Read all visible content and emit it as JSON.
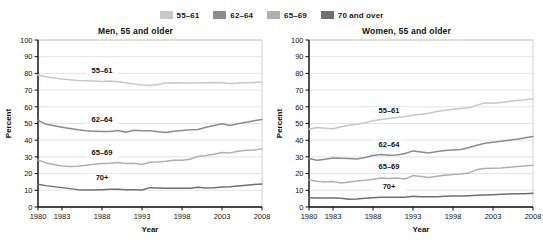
{
  "legend": {
    "position": "top-center",
    "items": [
      {
        "label": "55–61",
        "color": "#c8c8c8",
        "icon": "legend-swatch-icon"
      },
      {
        "label": "62–64",
        "color": "#8c8c8c",
        "icon": "legend-swatch-icon"
      },
      {
        "label": "65–69",
        "color": "#b0b0b0",
        "icon": "legend-swatch-icon"
      },
      {
        "label": "70 and over",
        "color": "#707070",
        "icon": "legend-swatch-icon"
      }
    ]
  },
  "chart_data": [
    {
      "type": "line",
      "title": "Men, 55 and older",
      "xlabel": "Year",
      "ylabel": "Percent",
      "xlim": [
        1980,
        2008
      ],
      "ylim": [
        0,
        100
      ],
      "grid": true,
      "legend_position": "top-center-shared",
      "xticks": [
        1980,
        1983,
        1988,
        1993,
        1998,
        2003,
        2008
      ],
      "yticks": [
        0,
        10,
        20,
        30,
        40,
        50,
        60,
        70,
        80,
        90,
        100
      ],
      "x": [
        1980,
        1981,
        1982,
        1983,
        1984,
        1985,
        1986,
        1987,
        1988,
        1989,
        1990,
        1991,
        1992,
        1993,
        1994,
        1995,
        1996,
        1997,
        1998,
        1999,
        2000,
        2001,
        2002,
        2003,
        2004,
        2005,
        2006,
        2007,
        2008
      ],
      "series": [
        {
          "name": "55–61",
          "color": "#c8c8c8",
          "label_x": 1988,
          "label_y": 80,
          "values": [
            79.0,
            78.0,
            77.2,
            76.6,
            76.2,
            75.8,
            75.6,
            75.4,
            75.2,
            75.4,
            75.0,
            74.4,
            73.6,
            73.0,
            72.8,
            73.4,
            74.2,
            74.4,
            74.2,
            74.2,
            74.4,
            74.4,
            74.6,
            74.4,
            74.0,
            74.2,
            74.4,
            74.6,
            74.8
          ]
        },
        {
          "name": "62–64",
          "color": "#8c8c8c",
          "label_x": 1988,
          "label_y": 51,
          "values": [
            52.0,
            49.5,
            48.6,
            47.8,
            47.0,
            46.2,
            45.6,
            45.4,
            45.2,
            45.2,
            45.8,
            44.8,
            46.0,
            45.6,
            45.6,
            45.0,
            44.6,
            45.4,
            45.8,
            46.2,
            46.4,
            47.8,
            48.8,
            49.8,
            48.8,
            49.8,
            50.8,
            51.6,
            52.4
          ]
        },
        {
          "name": "65–69",
          "color": "#b0b0b0",
          "label_x": 1988,
          "label_y": 31,
          "values": [
            28.2,
            26.4,
            25.4,
            24.6,
            24.2,
            24.4,
            25.0,
            25.6,
            26.0,
            26.2,
            26.6,
            26.0,
            26.2,
            25.4,
            26.8,
            27.0,
            27.4,
            28.0,
            28.0,
            28.6,
            30.2,
            30.8,
            31.6,
            32.6,
            32.4,
            33.4,
            34.0,
            34.2,
            34.8
          ]
        },
        {
          "name": "70+",
          "color": "#707070",
          "label_x": 1988,
          "label_y": 16,
          "values": [
            13.6,
            12.8,
            12.2,
            11.6,
            11.0,
            10.4,
            10.2,
            10.2,
            10.4,
            10.6,
            10.6,
            10.4,
            10.4,
            10.2,
            11.6,
            11.4,
            11.2,
            11.2,
            11.2,
            11.2,
            11.8,
            11.4,
            11.6,
            12.0,
            12.2,
            12.6,
            13.0,
            13.4,
            13.8
          ]
        }
      ]
    },
    {
      "type": "line",
      "title": "Women, 55 and older",
      "xlabel": "Year",
      "ylabel": "Percent",
      "xlim": [
        1980,
        2008
      ],
      "ylim": [
        0,
        100
      ],
      "grid": true,
      "legend_position": "top-center-shared",
      "xticks": [
        1980,
        1983,
        1988,
        1993,
        1998,
        2003,
        2008
      ],
      "yticks": [
        0,
        10,
        20,
        30,
        40,
        50,
        60,
        70,
        80,
        90,
        100
      ],
      "x": [
        1980,
        1981,
        1982,
        1983,
        1984,
        1985,
        1986,
        1987,
        1988,
        1989,
        1990,
        1991,
        1992,
        1993,
        1994,
        1995,
        1996,
        1997,
        1998,
        1999,
        2000,
        2001,
        2002,
        2003,
        2004,
        2005,
        2006,
        2007,
        2008
      ],
      "series": [
        {
          "name": "55–61",
          "color": "#c8c8c8",
          "label_x": 1990,
          "label_y": 56,
          "values": [
            46.6,
            47.6,
            47.2,
            46.8,
            48.0,
            49.0,
            49.6,
            50.4,
            51.6,
            52.4,
            53.0,
            53.6,
            54.2,
            55.0,
            55.6,
            56.2,
            57.2,
            58.0,
            58.6,
            59.0,
            59.4,
            61.0,
            62.4,
            62.2,
            62.6,
            63.2,
            63.8,
            64.2,
            64.8
          ]
        },
        {
          "name": "62–64",
          "color": "#8c8c8c",
          "label_x": 1990,
          "label_y": 36,
          "values": [
            29.0,
            28.0,
            28.6,
            29.4,
            29.2,
            29.0,
            28.8,
            29.6,
            30.8,
            31.4,
            31.0,
            31.2,
            32.0,
            33.6,
            33.0,
            32.4,
            33.2,
            33.8,
            34.2,
            34.4,
            35.6,
            37.0,
            38.2,
            38.8,
            39.4,
            40.0,
            40.6,
            41.4,
            42.2
          ]
        },
        {
          "name": "65–69",
          "color": "#b0b0b0",
          "label_x": 1990,
          "label_y": 23,
          "values": [
            16.2,
            15.4,
            15.0,
            15.2,
            14.4,
            15.0,
            15.6,
            16.0,
            16.6,
            17.4,
            17.0,
            17.4,
            16.8,
            18.8,
            18.2,
            17.6,
            18.4,
            19.0,
            19.4,
            19.8,
            20.4,
            22.4,
            23.0,
            23.2,
            23.4,
            23.8,
            24.2,
            24.6,
            25.0
          ]
        },
        {
          "name": "70+",
          "color": "#707070",
          "label_x": 1990,
          "label_y": 11,
          "values": [
            5.6,
            5.4,
            5.4,
            5.4,
            5.2,
            4.6,
            4.8,
            5.2,
            5.6,
            5.8,
            5.8,
            5.8,
            5.8,
            6.4,
            6.2,
            6.2,
            6.2,
            6.4,
            6.6,
            6.6,
            6.8,
            7.0,
            7.2,
            7.4,
            7.6,
            7.8,
            8.0,
            8.0,
            8.2
          ]
        }
      ]
    }
  ]
}
